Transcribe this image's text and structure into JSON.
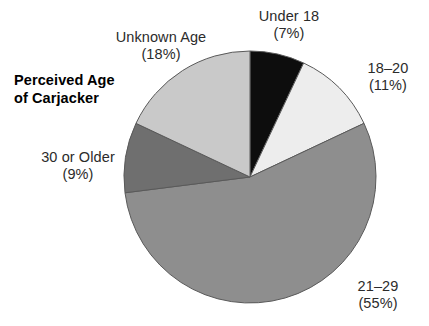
{
  "background": "#ffffff",
  "title": {
    "line1": "Perceived Age",
    "line2": "of Carjacker"
  },
  "labels": {
    "under18": {
      "category": "Under 18",
      "percent": "(7%)"
    },
    "age18_20": {
      "category": "18–20",
      "percent": "(11%)"
    },
    "age21_29": {
      "category": "21–29",
      "percent": "(55%)"
    },
    "age30_older": {
      "category": "30 or Older",
      "percent": "(9%)"
    },
    "unknown": {
      "category": "Unknown Age",
      "percent": "(18%)"
    }
  },
  "chart_data": {
    "type": "pie",
    "title": "Perceived Age of Carjacker",
    "xlabel": "",
    "ylabel": "",
    "grid": false,
    "legend": "none",
    "label_format": "category + percent outside slice",
    "start_angle_deg": 0,
    "direction": "clockwise",
    "center": {
      "x": 250,
      "y": 177
    },
    "radius": 126,
    "categories": [
      "Under 18",
      "18–20",
      "21–29",
      "30 or Older",
      "Unknown Age"
    ],
    "values": [
      7,
      11,
      55,
      9,
      18
    ],
    "value_unit": "percent",
    "colors": [
      "#0d0d0d",
      "#ededed",
      "#8e8e8e",
      "#6f6f6f",
      "#c9c9c9"
    ],
    "slice_outline": "#5a5a5a",
    "slices": [
      {
        "label": "Under 18",
        "percent": 7,
        "color": "#0d0d0d",
        "start_deg": 0.0,
        "end_deg": 25.2
      },
      {
        "label": "18–20",
        "percent": 11,
        "color": "#ededed",
        "start_deg": 25.2,
        "end_deg": 64.8
      },
      {
        "label": "21–29",
        "percent": 55,
        "color": "#8e8e8e",
        "start_deg": 64.8,
        "end_deg": 262.8
      },
      {
        "label": "30 or Older",
        "percent": 9,
        "color": "#6f6f6f",
        "start_deg": 262.8,
        "end_deg": 295.2
      },
      {
        "label": "Unknown Age",
        "percent": 18,
        "color": "#c9c9c9",
        "start_deg": 295.2,
        "end_deg": 360.0
      }
    ]
  }
}
